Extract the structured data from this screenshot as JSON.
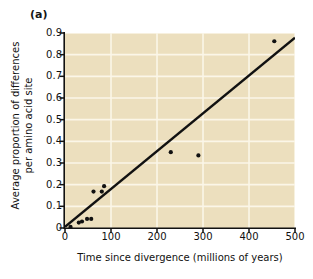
{
  "panel": {
    "label": "(a)"
  },
  "colors": {
    "plot_background": "#ecdfbe",
    "gridline": "#fbf6e8",
    "axis": "#111111",
    "point": "#111111",
    "trendline": "#111111",
    "page_background": "#ffffff"
  },
  "chart_data": {
    "type": "scatter",
    "title": "(a)",
    "xlabel": "Time since divergence (millions of years)",
    "ylabel_line1": "Average proportion of differences",
    "ylabel_line2": "per amino acid site",
    "ylabel": "Average proportion of differences per amino acid site",
    "xlim": [
      0,
      500
    ],
    "ylim": [
      0,
      0.9
    ],
    "xticks": [
      0,
      100,
      200,
      300,
      400,
      500
    ],
    "xtick_labels": [
      "0",
      "100",
      "200",
      "300",
      "400",
      "500"
    ],
    "yticks": [
      0,
      0.1,
      0.2,
      0.3,
      0.4,
      0.5,
      0.6,
      0.7,
      0.8,
      0.9
    ],
    "ytick_labels": [
      "0",
      "0.1",
      "0.2",
      "0.3",
      "0.4",
      "0.5",
      "0.6",
      "0.7",
      "0.8",
      "0.9"
    ],
    "grid": true,
    "grid_color": "#fbf6e8",
    "legend": false,
    "legend_position": "none",
    "marker": "filled-circle",
    "marker_size_px": 3,
    "points": [
      {
        "x": 12,
        "y": 0.005
      },
      {
        "x": 30,
        "y": 0.025
      },
      {
        "x": 37,
        "y": 0.03
      },
      {
        "x": 48,
        "y": 0.042
      },
      {
        "x": 57,
        "y": 0.042
      },
      {
        "x": 62,
        "y": 0.168
      },
      {
        "x": 80,
        "y": 0.168
      },
      {
        "x": 85,
        "y": 0.193
      },
      {
        "x": 230,
        "y": 0.35
      },
      {
        "x": 290,
        "y": 0.335
      },
      {
        "x": 455,
        "y": 0.862
      }
    ],
    "trendline": {
      "type": "linear-fit",
      "x_start": 0,
      "y_start": 0.005,
      "x_end": 500,
      "y_end": 0.878,
      "width_px": 2.4
    }
  }
}
